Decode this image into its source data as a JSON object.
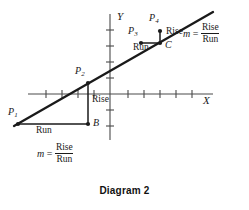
{
  "figure": {
    "caption": "Diagram 2",
    "line_color": "#1a1a1a",
    "axis_color": "#4a4a4a",
    "background": "#ffffff"
  },
  "axes": {
    "x_label": "X",
    "y_label": "Y",
    "origin": {
      "x": 110,
      "y": 94
    },
    "x_range": [
      28,
      213
    ],
    "y_range": [
      14,
      140
    ],
    "x_ticks_left": 4,
    "x_ticks_right": 5,
    "y_ticks_up": 4,
    "y_ticks_down": 2,
    "tick_spacing": 16,
    "tick_length": 5
  },
  "line": {
    "start": {
      "x": 14,
      "y": 126
    },
    "end": {
      "x": 213,
      "y": 12
    },
    "slope_description": "rising line through P1, P2, P3, P4"
  },
  "points": [
    {
      "id": "P1",
      "label": "P",
      "subscript": "1",
      "x": 18,
      "y": 124,
      "label_x": 8,
      "label_y": 108
    },
    {
      "id": "P2",
      "label": "P",
      "subscript": "2",
      "x": 88,
      "y": 83,
      "label_x": 76,
      "label_y": 67
    },
    {
      "id": "B",
      "label": "B",
      "subscript": "",
      "x": 88,
      "y": 124,
      "label_x": 93,
      "label_y": 120
    },
    {
      "id": "P3",
      "label": "P",
      "subscript": "3",
      "x": 141,
      "y": 43,
      "label_x": 129,
      "label_y": 27
    },
    {
      "id": "P4",
      "label": "P",
      "subscript": "4",
      "x": 160,
      "y": 32,
      "label_x": 150,
      "label_y": 16
    },
    {
      "id": "C",
      "label": "C",
      "subscript": "",
      "x": 160,
      "y": 43,
      "label_x": 165,
      "label_y": 41
    }
  ],
  "triangles": {
    "lower": {
      "rise_label": "Rise",
      "run_label": "Run",
      "rise_label_x": 93,
      "rise_label_y": 98,
      "run_label_x": 38,
      "run_label_y": 128,
      "vertical": {
        "x": 88,
        "y1": 83,
        "y2": 124
      },
      "horizontal": {
        "y": 124,
        "x1": 18,
        "x2": 88
      }
    },
    "upper": {
      "rise_label": "Rise",
      "run_label": "Run",
      "rise_label_x": 166,
      "rise_label_y": 28,
      "run_label_x": 134,
      "run_label_y": 45,
      "vertical": {
        "x": 160,
        "y1": 32,
        "y2": 43
      },
      "horizontal": {
        "y": 43,
        "x1": 141,
        "x2": 160
      }
    }
  },
  "formulas": [
    {
      "id": "formula-upper-right",
      "m": "m",
      "equals": "=",
      "numerator": "Rise",
      "denominator": "Run",
      "x": 183,
      "y": 30
    },
    {
      "id": "formula-lower-left",
      "m": "m",
      "equals": "=",
      "numerator": "Rise",
      "denominator": "Run",
      "x": 38,
      "y": 148
    }
  ]
}
